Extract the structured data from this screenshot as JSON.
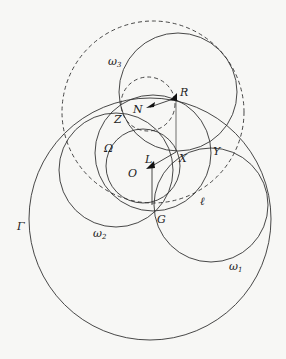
{
  "figure": {
    "stroke_color": "#333333",
    "background": "#f7f7f5",
    "circles": [
      {
        "name": "Gamma",
        "label": "Γ",
        "cx": 150,
        "cy": 219,
        "r": 121,
        "dashed": false
      },
      {
        "name": "big-dashed",
        "cx": 153,
        "cy": 112,
        "r": 91,
        "dashed": true
      },
      {
        "name": "omega3",
        "label": "ω3",
        "cx": 178,
        "cy": 92,
        "r": 59,
        "dashed": false
      },
      {
        "name": "small-dashed",
        "cx": 148,
        "cy": 104,
        "r": 27,
        "dashed": true
      },
      {
        "name": "Omega",
        "label": "Ω",
        "cx": 143,
        "cy": 166,
        "r": 37,
        "dashed": false
      },
      {
        "name": "middle-circle",
        "cx": 153,
        "cy": 153,
        "r": 58,
        "dashed": false
      },
      {
        "name": "omega2",
        "label": "ω2",
        "cx": 116,
        "cy": 170,
        "r": 57,
        "dashed": false
      },
      {
        "name": "omega1",
        "label": "ω1",
        "cx": 211,
        "cy": 205,
        "r": 57,
        "dashed": false
      }
    ],
    "labels": {
      "omega3": "ω",
      "omega3_sub": "3",
      "R": "R",
      "N": "N",
      "Z": "Z",
      "Omega": "Ω",
      "L": "L",
      "X": "X",
      "Y": "Y",
      "O": "O",
      "ell": "ℓ",
      "G": "G",
      "Gamma": "Γ",
      "omega2": "ω",
      "omega2_sub": "2",
      "omega1": "ω",
      "omega1_sub": "1"
    },
    "points": {
      "R": [
        176,
        98
      ],
      "N": [
        148,
        107
      ],
      "Z": [
        121,
        110
      ],
      "X": [
        176,
        152
      ],
      "Y": [
        211,
        146
      ],
      "L": [
        150,
        167
      ],
      "O": [
        143,
        172
      ],
      "G": [
        152,
        205
      ]
    }
  }
}
